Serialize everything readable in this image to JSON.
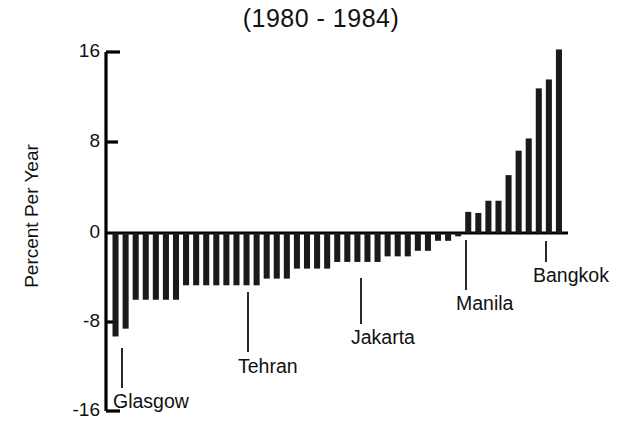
{
  "chart_data": {
    "type": "bar",
    "title": "(1980 - 1984)",
    "subtitle": "",
    "xlabel": "",
    "ylabel": "Percent Per Year",
    "ylim": [
      -16,
      16
    ],
    "yticks": [
      16,
      8,
      0,
      -8,
      -16
    ],
    "ytick_labels": [
      "16",
      "8",
      "0",
      "-8",
      "-16"
    ],
    "grid": false,
    "legend": null,
    "xaxis_ticks_shown": false,
    "bar_color": "#1a1a1a",
    "axis_color": "#000000",
    "n_bars": 42,
    "values": [
      -9.3,
      -8.6,
      -6.0,
      -6.0,
      -6.0,
      -6.0,
      -6.0,
      -4.7,
      -4.7,
      -4.7,
      -4.7,
      -4.7,
      -4.7,
      -4.7,
      -4.7,
      -4.1,
      -4.1,
      -4.1,
      -3.2,
      -3.2,
      -3.2,
      -3.2,
      -2.6,
      -2.6,
      -2.6,
      -2.6,
      -2.6,
      -2.1,
      -2.1,
      -2.1,
      -1.6,
      -1.6,
      -0.7,
      -0.7,
      -0.3,
      1.9,
      1.8,
      2.9,
      2.9,
      5.2,
      7.4,
      8.5,
      13.0,
      13.8,
      16.5
    ],
    "annotations": [
      {
        "label": "Glasgow",
        "bar_index": 0,
        "value": -9.3
      },
      {
        "label": "Tehran",
        "bar_index": 12,
        "value": -4.7
      },
      {
        "label": "Jakarta",
        "bar_index": 23,
        "value": -2.6
      },
      {
        "label": "Manila",
        "bar_index": 35,
        "value": 1.9
      },
      {
        "label": "Bangkok",
        "bar_index": 43,
        "value": 13.8
      }
    ]
  },
  "annotation_labels": {
    "glasgow": "Glasgow",
    "tehran": "Tehran",
    "jakarta": "Jakarta",
    "manila": "Manila",
    "bangkok": "Bangkok"
  },
  "axis": {
    "tick_16": "16",
    "tick_8": "8",
    "tick_0": "0",
    "tick_neg8": "-8",
    "tick_neg16": "-16"
  }
}
